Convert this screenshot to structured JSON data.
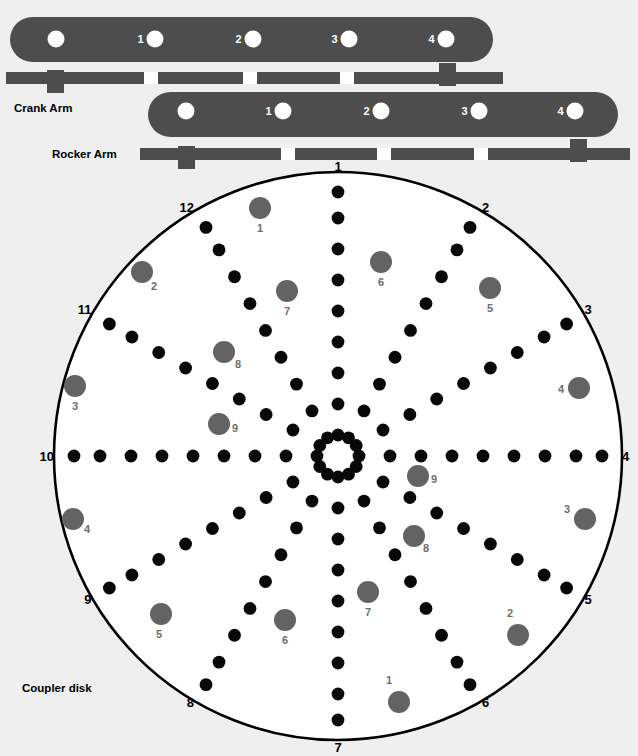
{
  "figure": {
    "background_color": "#efefef",
    "disk_fill": "#ffffff",
    "arm_color": "#4d4d4d",
    "black_dot_color": "#080808",
    "gray_dot_color": "#636363",
    "gray_label_color": "#6d6d6d"
  },
  "labels": {
    "crank_arm": "Crank Arm",
    "rocker_arm": "Rocker Arm",
    "coupler_disk": "Coupler disk"
  },
  "crank_arm": {
    "name": "Crank Arm",
    "body": {
      "x": 10,
      "y": 17,
      "width": 483,
      "height": 45,
      "rx": 22.5
    },
    "pivot_hole": {
      "cx": 56,
      "cy": 39,
      "r": 8.5
    },
    "holes": [
      {
        "label": "1",
        "cx": 155,
        "cy": 39,
        "r": 8.5
      },
      {
        "label": "2",
        "cx": 253,
        "cy": 39,
        "r": 8.5
      },
      {
        "label": "3",
        "cx": 349,
        "cy": 39,
        "r": 8.5
      },
      {
        "label": "4",
        "cx": 446,
        "cy": 39,
        "r": 8.5
      }
    ],
    "bar": {
      "x": 6,
      "y": 72,
      "width": 497,
      "height": 12
    },
    "bar_ticks": [
      {
        "x": 144,
        "width": 14
      },
      {
        "x": 243,
        "width": 14
      },
      {
        "x": 340,
        "width": 14
      }
    ],
    "blocks": [
      {
        "x": 47,
        "y": 70,
        "width": 17,
        "height": 23
      },
      {
        "x": 439,
        "y": 63,
        "width": 17,
        "height": 23
      }
    ],
    "label_pos": {
      "x": 14,
      "y": 112
    }
  },
  "rocker_arm": {
    "name": "Rocker Arm",
    "body": {
      "x": 148,
      "y": 92,
      "width": 470,
      "height": 45,
      "rx": 22.5
    },
    "pivot_hole": {
      "cx": 186,
      "cy": 111,
      "r": 8.5
    },
    "holes": [
      {
        "label": "1",
        "cx": 283,
        "cy": 111,
        "r": 8.5
      },
      {
        "label": "2",
        "cx": 381,
        "cy": 111,
        "r": 8.5
      },
      {
        "label": "3",
        "cx": 479,
        "cy": 111,
        "r": 8.5
      },
      {
        "label": "4",
        "cx": 575,
        "cy": 111,
        "r": 8.5
      }
    ],
    "bar": {
      "x": 140,
      "y": 148,
      "width": 490,
      "height": 12
    },
    "bar_ticks": [
      {
        "x": 281,
        "width": 14
      },
      {
        "x": 377,
        "width": 14
      },
      {
        "x": 474,
        "width": 14
      }
    ],
    "blocks": [
      {
        "x": 178,
        "y": 146,
        "width": 17,
        "height": 23
      },
      {
        "x": 570,
        "y": 139,
        "width": 17,
        "height": 23
      }
    ],
    "label_pos": {
      "x": 52,
      "y": 158
    }
  },
  "coupler_disk": {
    "name": "Coupler disk",
    "center": {
      "x": 338,
      "y": 456
    },
    "radius": 284,
    "label_pos": {
      "x": 22,
      "y": 692
    },
    "spoke_count": 12,
    "spoke_labels": [
      "1",
      "2",
      "3",
      "4",
      "5",
      "6",
      "7",
      "8",
      "9",
      "10",
      "11",
      "12"
    ],
    "dots_per_spoke": 9,
    "dot_radius": 6.4,
    "dot_radii": [
      21,
      52,
      83,
      114,
      145,
      176,
      207,
      238,
      264
    ],
    "spoke_angles_deg": [
      270,
      300,
      330,
      0,
      30,
      60,
      90,
      120,
      150,
      180,
      210,
      240
    ],
    "spoke_label_radius": 280,
    "gray_markers": [
      {
        "label": "1",
        "cx": 260,
        "cy": 208,
        "r": 11
      },
      {
        "label": "2",
        "cx": 142,
        "cy": 272,
        "r": 11
      },
      {
        "label": "3",
        "cx": 75,
        "cy": 386,
        "r": 11
      },
      {
        "label": "4",
        "cx": 73,
        "cy": 519,
        "r": 11
      },
      {
        "label": "5",
        "cx": 161,
        "cy": 614,
        "r": 11
      },
      {
        "label": "6",
        "cx": 285,
        "cy": 620,
        "r": 11
      },
      {
        "label": "7",
        "cx": 368,
        "cy": 592,
        "r": 11
      },
      {
        "label": "8",
        "cx": 414,
        "cy": 536,
        "r": 11
      },
      {
        "label": "9",
        "cx": 418,
        "cy": 476,
        "r": 11
      },
      {
        "label": "7",
        "cx": 287,
        "cy": 291,
        "r": 11
      },
      {
        "label": "8",
        "cx": 224,
        "cy": 352,
        "r": 11
      },
      {
        "label": "9",
        "cx": 219,
        "cy": 424,
        "r": 11
      },
      {
        "label": "6",
        "cx": 381,
        "cy": 262,
        "r": 11
      },
      {
        "label": "5",
        "cx": 490,
        "cy": 288,
        "r": 11
      },
      {
        "label": "4",
        "cx": 579,
        "cy": 388,
        "r": 11
      },
      {
        "label": "3",
        "cx": 585,
        "cy": 519,
        "r": 11
      },
      {
        "label": "2",
        "cx": 518,
        "cy": 635,
        "r": 11
      },
      {
        "label": "1",
        "cx": 399,
        "cy": 702,
        "r": 11
      }
    ],
    "gray_label_offsets": [
      {
        "dx": 0,
        "dy": 24
      },
      {
        "dx": 12,
        "dy": 18
      },
      {
        "dx": 0,
        "dy": 24
      },
      {
        "dx": 14,
        "dy": 14
      },
      {
        "dx": -2,
        "dy": 24
      },
      {
        "dx": 0,
        "dy": 24
      },
      {
        "dx": 0,
        "dy": 24
      },
      {
        "dx": 12,
        "dy": 16
      },
      {
        "dx": 16,
        "dy": 7
      },
      {
        "dx": 0,
        "dy": 24
      },
      {
        "dx": 14,
        "dy": 16
      },
      {
        "dx": 16,
        "dy": 8
      },
      {
        "dx": 0,
        "dy": 24
      },
      {
        "dx": 0,
        "dy": 24
      },
      {
        "dx": -18,
        "dy": 5
      },
      {
        "dx": -18,
        "dy": -6
      },
      {
        "dx": -8,
        "dy": -18
      },
      {
        "dx": -10,
        "dy": -18
      }
    ]
  }
}
